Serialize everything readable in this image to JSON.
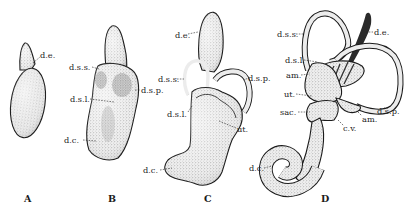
{
  "figure": {
    "colors": {
      "ink": "#1b1b1b",
      "stipple_light": "#e6e6e6",
      "stipple_mid": "#cfcfcf",
      "stipple_dark": "#9a9a9a",
      "background": "#ffffff"
    },
    "panels": [
      {
        "letter": "A",
        "labels": [
          {
            "text": "d.e."
          }
        ]
      },
      {
        "letter": "B",
        "labels": [
          {
            "text": "d.s.s."
          },
          {
            "text": "d.s.l."
          },
          {
            "text": "d.s.p."
          },
          {
            "text": "d.c."
          }
        ]
      },
      {
        "letter": "C",
        "labels": [
          {
            "text": "d.e."
          },
          {
            "text": "d.s.s."
          },
          {
            "text": "d.s.p."
          },
          {
            "text": "d.s.l."
          },
          {
            "text": "ut."
          },
          {
            "text": "d.c."
          }
        ]
      },
      {
        "letter": "D",
        "labels": [
          {
            "text": "d.s.s."
          },
          {
            "text": "d.e."
          },
          {
            "text": "d.s.l."
          },
          {
            "text": "am."
          },
          {
            "text": "ut."
          },
          {
            "text": "sac."
          },
          {
            "text": "c.v."
          },
          {
            "text": "d.s.p."
          },
          {
            "text": "am."
          },
          {
            "text": "d.c."
          }
        ]
      }
    ]
  }
}
